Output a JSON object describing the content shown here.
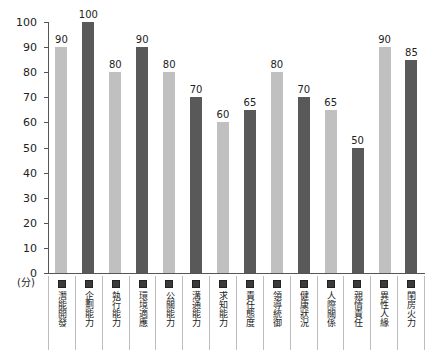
{
  "chart_data": {
    "type": "bar",
    "title": "",
    "xlabel": "",
    "ylabel": "(分)",
    "ylim": [
      0,
      100
    ],
    "ytick_step": 10,
    "yticks": [
      0,
      10,
      20,
      30,
      40,
      50,
      60,
      70,
      80,
      90,
      100
    ],
    "grid": false,
    "legend_position": "below-axis-vertical-labels",
    "categories": [
      "潛能開發",
      "企劃能力",
      "執行能力",
      "環境適應",
      "公關能力",
      "溝通能力",
      "求知能力",
      "責任態度",
      "領導統御",
      "健康狀況",
      "人際關係",
      "親情責任",
      "異性人緣",
      "閨房火力"
    ],
    "values": [
      90,
      100,
      80,
      90,
      80,
      70,
      60,
      65,
      80,
      70,
      65,
      50,
      90,
      85
    ],
    "bar_colors": [
      "#c0c0c0",
      "#595959",
      "#c0c0c0",
      "#595959",
      "#c0c0c0",
      "#595959",
      "#c0c0c0",
      "#595959",
      "#c0c0c0",
      "#595959",
      "#c0c0c0",
      "#595959",
      "#c0c0c0",
      "#595959"
    ],
    "legend_marker_color": "#3a3a3a"
  },
  "colors": {
    "light_bar": "#c0c0c0",
    "dark_bar": "#595959",
    "axis": "#555555",
    "legend_border": "#bdbdbd",
    "text": "#222222",
    "background": "#ffffff"
  }
}
